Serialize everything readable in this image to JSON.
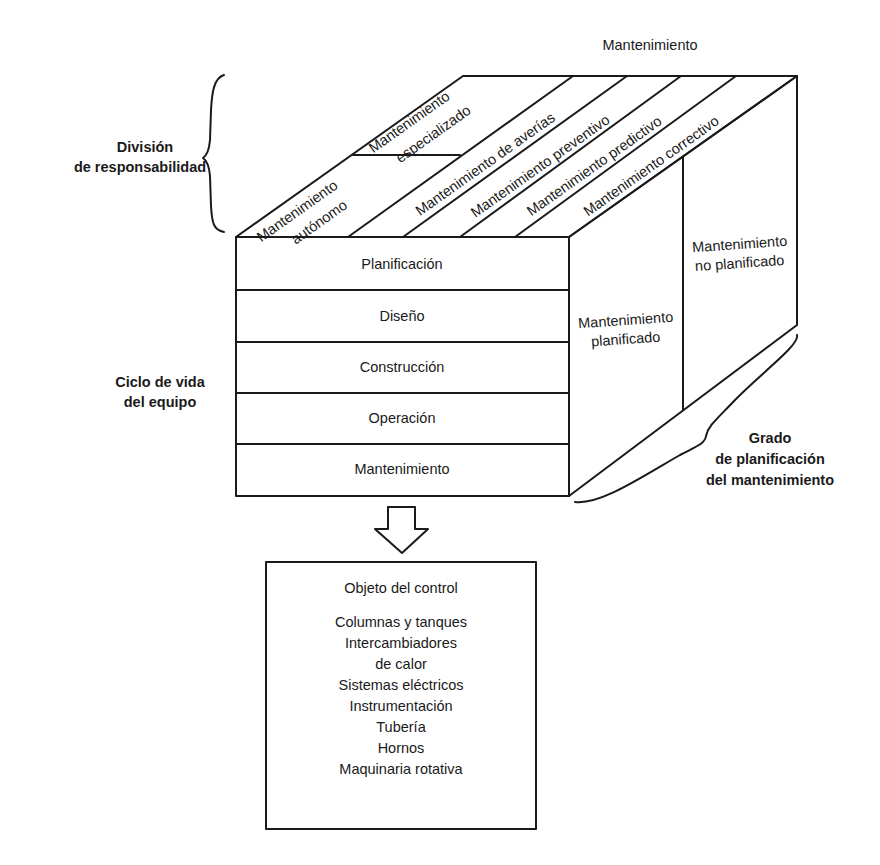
{
  "top_label": "Mantenimiento",
  "left_labels": {
    "division": [
      "División",
      "de responsabilidad"
    ],
    "ciclo": [
      "Ciclo de vida",
      "del equipo"
    ]
  },
  "right_label": [
    "Grado",
    "de planificación",
    "del mantenimiento"
  ],
  "top_face": {
    "stripes": [
      {
        "lines": [
          "Mantenimiento",
          "autónomo"
        ]
      },
      {
        "lines": [
          "Mantenimiento",
          "especializado"
        ]
      },
      {
        "lines": [
          "Mantenimiento de averías"
        ]
      },
      {
        "lines": [
          "Mantenimiento preventivo"
        ]
      },
      {
        "lines": [
          "Mantenimiento predictivo"
        ]
      },
      {
        "lines": [
          "Mantenimiento correctivo"
        ]
      }
    ]
  },
  "front_face": {
    "rows": [
      "Planificación",
      "Diseño",
      "Construcción",
      "Operación",
      "Mantenimiento"
    ]
  },
  "side_face": {
    "planned": [
      "Mantenimiento",
      "planificado"
    ],
    "unplanned": [
      "Mantenimiento",
      "no planificado"
    ]
  },
  "control_box": {
    "title": "Objeto del control",
    "items": [
      "Columnas y tanques",
      "Intercambiadores",
      "de calor",
      "Sistemas eléctricos",
      "Instrumentación",
      "Tubería",
      "Hornos",
      "Maquinaria rotativa"
    ]
  }
}
